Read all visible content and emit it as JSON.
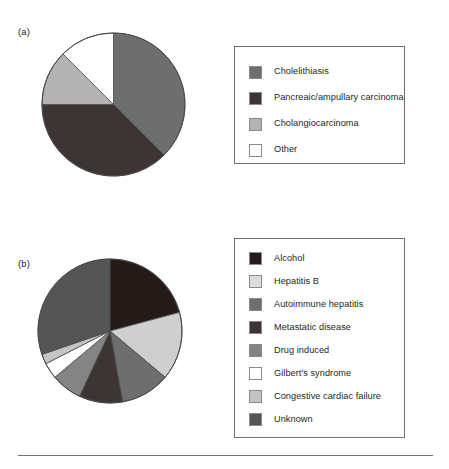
{
  "figure": {
    "background": "#ffffff",
    "rule_color": "#6f6f6f"
  },
  "panels": [
    {
      "id": "a",
      "label": "(a)",
      "pie": {
        "cx": 113.5,
        "cy": 104.5,
        "r": 71.5,
        "stroke": "#4a4a4a"
      },
      "legend": {
        "x": 234,
        "y": 46,
        "w": 171,
        "h": 118
      }
    },
    {
      "id": "b",
      "label": "(b)",
      "pie": {
        "cx": 110,
        "cy": 331,
        "r": 72,
        "stroke": "#4a4a4a"
      },
      "legend": {
        "x": 234,
        "y": 238,
        "w": 171,
        "h": 200
      }
    }
  ],
  "chart_data": [
    {
      "type": "pie",
      "title": "(a)",
      "start_angle": 0,
      "direction": "clockwise",
      "categories": [
        "Cholelithiasis",
        "Pancreaic/ampullary carcinoma",
        "Cholangiocarcinoma",
        "Other"
      ],
      "values": [
        37.5,
        37.5,
        12.5,
        12.5
      ],
      "units": "percent",
      "angles_deg": [
        135,
        135,
        45,
        45
      ],
      "colors": [
        "#6e6e6e",
        "#3c3533",
        "#b3b3b3",
        "#ffffff"
      ],
      "legend_position": "right",
      "grid": false
    },
    {
      "type": "pie",
      "title": "(b)",
      "start_angle": 0,
      "direction": "clockwise",
      "categories": [
        "Alcohol",
        "Hepatitis B",
        "Autoimmune hepatitis",
        "Metastatic disease",
        "Drug induced",
        "Gilbert's syndrome",
        "Congestive cardiac failure",
        "Unknown"
      ],
      "values": [
        20.8,
        15.3,
        11.1,
        9.7,
        6.9,
        3.6,
        2.2,
        30.4
      ],
      "units": "percent",
      "angles_deg": [
        75,
        55,
        40,
        35,
        25,
        13,
        8,
        109
      ],
      "colors": [
        "#241a18",
        "#cfcfcf",
        "#6e6e6e",
        "#3c3533",
        "#848484",
        "#ffffff",
        "#c4c4c4",
        "#555555"
      ],
      "legend_position": "right",
      "grid": false
    }
  ],
  "legend_a": {
    "items": [
      {
        "label": "Cholelithiasis",
        "color": "#6e6e6e"
      },
      {
        "label": "Pancreaic/ampullary carcinoma",
        "color": "#3c3533"
      },
      {
        "label": "Cholangiocarcinoma",
        "color": "#b3b3b3"
      },
      {
        "label": "Other",
        "color": "#ffffff"
      }
    ]
  },
  "legend_b": {
    "items": [
      {
        "label": "Alcohol",
        "color": "#241a18"
      },
      {
        "label": "Hepatitis B",
        "color": "#dcdcdc"
      },
      {
        "label": "Autoimmune hepatitis",
        "color": "#6e6e6e"
      },
      {
        "label": "Metastatic disease",
        "color": "#3c3533"
      },
      {
        "label": "Drug induced",
        "color": "#848484"
      },
      {
        "label": "Gilbert's syndrome",
        "color": "#ffffff"
      },
      {
        "label": "Congestive cardiac failure",
        "color": "#c4c4c4"
      },
      {
        "label": "Unknown",
        "color": "#555555"
      }
    ]
  }
}
